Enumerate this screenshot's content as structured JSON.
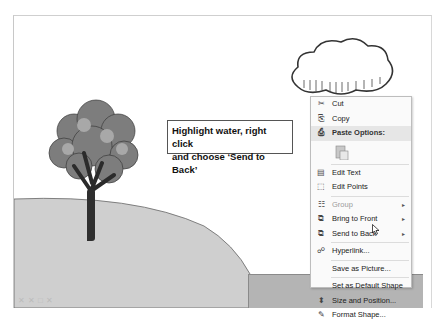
{
  "slide": {
    "callout_text_line1": "Highlight water, right click",
    "callout_text_line2": "and choose ‘Send to Back’",
    "colors": {
      "hill": "#cfcfcf",
      "water": "#b4b4b4",
      "menu_bg": "#fafafa",
      "menu_header": "#e6e6e6"
    }
  },
  "context_menu": {
    "items": [
      {
        "label": "Cut",
        "icon": "scissors-icon",
        "glyph": "✂"
      },
      {
        "label": "Copy",
        "icon": "copy-icon",
        "glyph": "⎘"
      },
      {
        "label": "Paste Options:",
        "icon": "paste-icon",
        "glyph": "⎙",
        "header": true
      },
      {
        "label": "Edit Text",
        "icon": "edit-text-icon",
        "glyph": "▤"
      },
      {
        "label": "Edit Points",
        "icon": "edit-points-icon",
        "glyph": "⬚"
      },
      {
        "label": "Group",
        "icon": "group-icon",
        "glyph": "☷",
        "disabled": true,
        "submenu": "▸"
      },
      {
        "label": "Bring to Front",
        "icon": "bring-to-front-icon",
        "glyph": "⧉",
        "submenu": "▸"
      },
      {
        "label": "Send to Back",
        "icon": "send-to-back-icon",
        "glyph": "⧉",
        "submenu": "▸"
      },
      {
        "label": "Hyperlink...",
        "icon": "hyperlink-icon",
        "glyph": "☍"
      },
      {
        "label": "Save as Picture..."
      },
      {
        "label": "Set as Default Shape"
      },
      {
        "label": "Size and Position...",
        "icon": "size-position-icon",
        "glyph": "⬍"
      },
      {
        "label": "Format Shape...",
        "icon": "format-shape-icon",
        "glyph": "✎"
      }
    ]
  }
}
